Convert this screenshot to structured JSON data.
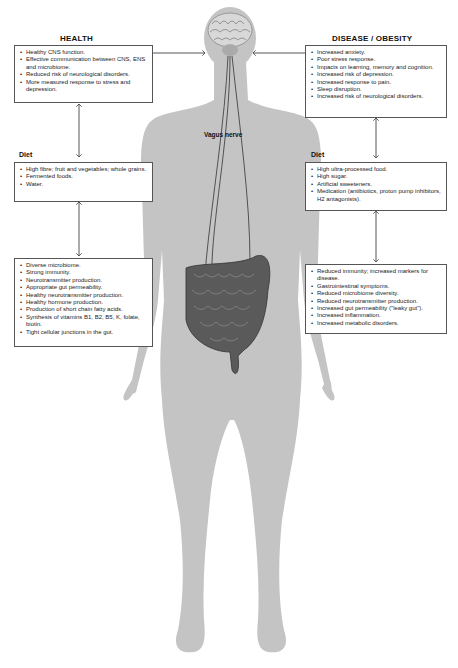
{
  "health": {
    "title": "HEALTH",
    "outcomes": [
      "Healthy CNS function.",
      "Effective communication between CNS, ENS and microbiome.",
      "Reduced risk of neurological disorders.",
      "More measured response to stress and depression."
    ],
    "diet_label": "Diet",
    "diet": [
      "High fibre; fruit and vegetables; whole grains.",
      "Fermented foods.",
      "Water."
    ],
    "gut": [
      "Diverse microbiome.",
      "Strong immunity.",
      "Neurotransmitter production.",
      "Appropriate gut permeability.",
      "Healthy neurotransmitter production.",
      "Healthy hormone production.",
      "Production of short chain fatty acids.",
      "Synthesis of vitamins B1, B2, B5, K, folate, biotin.",
      "Tight cellular junctions in the gut."
    ]
  },
  "disease": {
    "title": "DISEASE / OBESITY",
    "outcomes": [
      "Increased anxiety.",
      "Poor stress response.",
      "Impacts on learning, memory and cognition.",
      "Increased risk of depression.",
      "Increased response to pain.",
      "Sleep disruption.",
      "Increased risk of neurological disorders."
    ],
    "diet_label": "Diet",
    "diet": [
      "High ultra-processed food.",
      "High sugar.",
      "Artificial sweeteners.",
      "Medication (antibiotics, proton pump inhibitors, H2 antagonists)."
    ],
    "gut": [
      "Reduced immunity; increased markers for disease.",
      "Gastrointestinal symptoms.",
      "Reduced microbiome diversity.",
      "Reduced neurotransmitter production.",
      "Increased gut permeability (\"leaky gut\").",
      "Increased inflammation.",
      "Increased metabolic disorders."
    ]
  },
  "center": {
    "nerve_label": "Vagus nerve",
    "brain_icon": "brain-icon",
    "gut_icon": "intestines-icon"
  },
  "colors": {
    "silhouette": "#c4c4c4",
    "box_border": "#555555",
    "arrow": "#444444",
    "intestine": "#555555"
  }
}
